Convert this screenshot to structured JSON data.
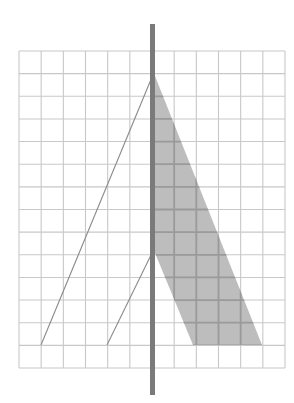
{
  "diagram": {
    "canvas": {
      "width": 294,
      "height": 403,
      "background": "#ffffff"
    },
    "grid": {
      "x0": 19,
      "x1": 285,
      "columns": 12,
      "y0": 51,
      "y1": 368,
      "rows": 14,
      "line_color": "#c8c8c8",
      "line_width": 1.1
    },
    "pole": {
      "x": 150,
      "width": 5,
      "y_top": 24,
      "y_bottom": 395,
      "color": "#7a7a7a"
    },
    "diagonal_lines": [
      {
        "x1": 41,
        "y1": 345,
        "x2": 152,
        "y2": 77,
        "color": "#8a8a8a"
      },
      {
        "x1": 107,
        "y1": 345,
        "x2": 152,
        "y2": 253,
        "color": "#8a8a8a"
      }
    ],
    "shaded_region": {
      "points": [
        [
          155,
          76
        ],
        [
          262,
          345
        ],
        [
          193,
          345
        ],
        [
          155,
          253
        ]
      ],
      "fill": "#bdbdbd",
      "inner_grid_color": "#9a9a9a"
    }
  }
}
